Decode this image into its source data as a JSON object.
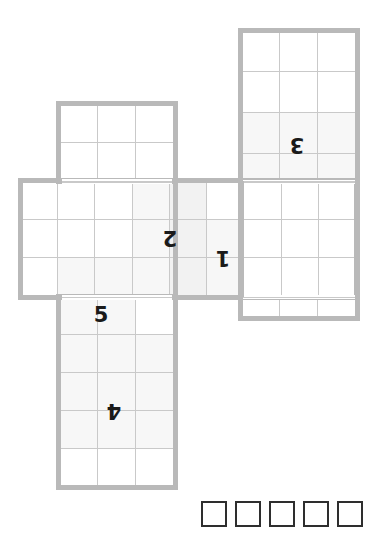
{
  "puzzle": {
    "type": "cube-net-folding-puzzle",
    "background_color": "#ffffff",
    "grid": {
      "cell_size_px": 38.7,
      "line_color": "#c9c9c9",
      "outer_border_color": "#b9b9b9",
      "outer_border_width_px": 5.5,
      "shade_color": "#f7f7f7"
    },
    "labels": [
      {
        "text": "1",
        "rotated_180": true
      },
      {
        "text": "2",
        "rotated_180": true
      },
      {
        "text": "3",
        "rotated_180": true
      },
      {
        "text": "4",
        "rotated_180": true
      },
      {
        "text": "5",
        "rotated_180": false
      }
    ],
    "blocks": [
      {
        "name": "top-right-panel",
        "columns": 3,
        "rows": 7
      },
      {
        "name": "upper-left-panel",
        "columns": 3,
        "rows": 2
      },
      {
        "name": "middle-band-panel",
        "columns": 9,
        "rows": 3
      },
      {
        "name": "bottom-left-panel",
        "columns": 3,
        "rows": 5
      }
    ],
    "answer_boxes": {
      "count": 5,
      "border_color": "#2e2e2e",
      "values": [
        "",
        "",
        "",
        "",
        ""
      ]
    }
  },
  "labels_text": {
    "one": "1",
    "two": "2",
    "three": "3",
    "four": "4",
    "five": "5"
  }
}
